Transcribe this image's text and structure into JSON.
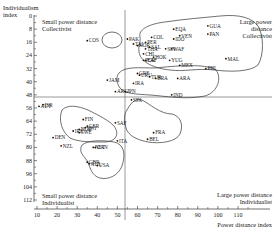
{
  "chart_data": {
    "type": "scatter",
    "title": "",
    "xlabel": "Power distance index",
    "ylabel": "Individualism index",
    "xlim": [
      5,
      120
    ],
    "ylim": [
      0,
      112
    ],
    "y_inverted": true,
    "x_ticks": [
      10,
      20,
      30,
      40,
      50,
      60,
      70,
      80,
      90,
      100,
      110
    ],
    "y_ticks": [
      0,
      8,
      16,
      24,
      32,
      40,
      48,
      56,
      64,
      72,
      80,
      88,
      96,
      104,
      112
    ],
    "grid": false,
    "dividers": {
      "x": 54,
      "y": 49
    },
    "quadrant_labels": [
      {
        "id": "tl",
        "lines": [
          "Small power distance",
          "Collectivist"
        ]
      },
      {
        "id": "tr",
        "lines": [
          "Large power",
          "distance",
          "Collectivist"
        ]
      },
      {
        "id": "bl",
        "lines": [
          "Small power distance",
          "Individualist"
        ]
      },
      {
        "id": "br",
        "lines": [
          "Large power distance",
          "Individualist"
        ]
      }
    ],
    "points": [
      {
        "label": "COS",
        "x": 35,
        "y": 15
      },
      {
        "label": "PAK",
        "x": 55,
        "y": 14
      },
      {
        "label": "COL",
        "x": 67,
        "y": 13
      },
      {
        "label": "EQA",
        "x": 78,
        "y": 8
      },
      {
        "label": "VEN",
        "x": 81,
        "y": 12
      },
      {
        "label": "IDO",
        "x": 78,
        "y": 14
      },
      {
        "label": "GUA",
        "x": 95,
        "y": 6
      },
      {
        "label": "PAN",
        "x": 95,
        "y": 11
      },
      {
        "label": "TAI",
        "x": 58,
        "y": 17
      },
      {
        "label": "PER",
        "x": 64,
        "y": 16
      },
      {
        "label": "SAL",
        "x": 66,
        "y": 19
      },
      {
        "label": "SIN",
        "x": 74,
        "y": 20
      },
      {
        "label": "WAF",
        "x": 77,
        "y": 20
      },
      {
        "label": "KOR",
        "x": 60,
        "y": 18
      },
      {
        "label": "THA",
        "x": 64,
        "y": 20
      },
      {
        "label": "CHL",
        "x": 63,
        "y": 23
      },
      {
        "label": "POR",
        "x": 63,
        "y": 27
      },
      {
        "label": "HOK",
        "x": 68,
        "y": 25
      },
      {
        "label": "EAF",
        "x": 64,
        "y": 27
      },
      {
        "label": "YUG",
        "x": 76,
        "y": 27
      },
      {
        "label": "MEX",
        "x": 81,
        "y": 30
      },
      {
        "label": "PHI",
        "x": 94,
        "y": 32
      },
      {
        "label": "MAL",
        "x": 104,
        "y": 26
      },
      {
        "label": "GRE",
        "x": 60,
        "y": 35
      },
      {
        "label": "JAM",
        "x": 45,
        "y": 39
      },
      {
        "label": "URU",
        "x": 61,
        "y": 36
      },
      {
        "label": "TUR",
        "x": 66,
        "y": 37
      },
      {
        "label": "BRA",
        "x": 69,
        "y": 38
      },
      {
        "label": "ARA",
        "x": 80,
        "y": 38
      },
      {
        "label": "IRA",
        "x": 58,
        "y": 41
      },
      {
        "label": "ARG",
        "x": 49,
        "y": 46
      },
      {
        "label": "JPN",
        "x": 54,
        "y": 46
      },
      {
        "label": "IND",
        "x": 77,
        "y": 48
      },
      {
        "label": "SPA",
        "x": 57,
        "y": 51
      },
      {
        "label": "ISR",
        "x": 13,
        "y": 54
      },
      {
        "label": "AUT",
        "x": 11,
        "y": 55
      },
      {
        "label": "FIN",
        "x": 33,
        "y": 63
      },
      {
        "label": "GER",
        "x": 35,
        "y": 67
      },
      {
        "label": "SWI",
        "x": 34,
        "y": 68
      },
      {
        "label": "NOR",
        "x": 31,
        "y": 69
      },
      {
        "label": "IRE",
        "x": 28,
        "y": 70
      },
      {
        "label": "SWE",
        "x": 31,
        "y": 71
      },
      {
        "label": "DEN",
        "x": 18,
        "y": 74
      },
      {
        "label": "SAF",
        "x": 49,
        "y": 65
      },
      {
        "label": "FRA",
        "x": 68,
        "y": 71
      },
      {
        "label": "BEL",
        "x": 65,
        "y": 75
      },
      {
        "label": "ITA",
        "x": 50,
        "y": 76
      },
      {
        "label": "NZL",
        "x": 22,
        "y": 79
      },
      {
        "label": "NET",
        "x": 38,
        "y": 80
      },
      {
        "label": "CAN",
        "x": 39,
        "y": 80
      },
      {
        "label": "GBR",
        "x": 35,
        "y": 89
      },
      {
        "label": "AUL",
        "x": 36,
        "y": 90
      },
      {
        "label": "USA",
        "x": 40,
        "y": 91
      }
    ]
  },
  "axes": {
    "y_title_line1": "Individualism",
    "y_title_line2": "index",
    "x_title": "Power distance index"
  }
}
